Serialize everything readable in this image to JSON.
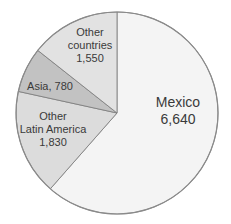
{
  "chart_data": {
    "type": "pie",
    "title": "",
    "categories": [
      "Mexico",
      "Other Latin America",
      "Asia",
      "Other countries"
    ],
    "values": [
      6640,
      1830,
      780,
      1550
    ],
    "value_labels": [
      "6,640",
      "1,830",
      "780",
      "1,550"
    ],
    "colors": [
      "#f4f4f4",
      "#dcdcdc",
      "#c2c2c2",
      "#e2e2e2"
    ],
    "start_angle_deg": 0,
    "direction": "clockwise",
    "legend": "none",
    "data_labels": true
  },
  "labels": {
    "mexico": {
      "line1": "Mexico",
      "line2": "6,640"
    },
    "other_latin_america": {
      "line1": "Other",
      "line2": "Latin America",
      "line3": "1,830"
    },
    "asia": {
      "line1": "Asia, 780"
    },
    "other_countries": {
      "line1": "Other",
      "line2": "countries",
      "line3": "1,550"
    }
  }
}
